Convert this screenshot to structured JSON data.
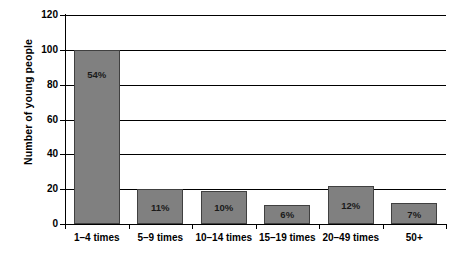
{
  "chart_data": {
    "type": "bar",
    "title": "",
    "subtitle": "",
    "xlabel": "",
    "ylabel": "Number of young people",
    "categories": [
      "1–4 times",
      "5–9 times",
      "10–14 times",
      "15–19 times",
      "20–49 times",
      "50+"
    ],
    "values": [
      100,
      20,
      19,
      11,
      22,
      12
    ],
    "data_labels": [
      "54%",
      "11%",
      "10%",
      "6%",
      "12%",
      "7%"
    ],
    "ylim": [
      0,
      120
    ],
    "ytick_values": [
      0,
      20,
      40,
      60,
      80,
      100,
      120
    ],
    "ytick_labels": [
      "0",
      "20",
      "40",
      "60",
      "80",
      "100",
      "120"
    ],
    "grid": "horizontal",
    "legend": "none",
    "bar_color": "#808080",
    "bar_edge_color": "#404040",
    "background_color": "#ffffff",
    "axis_color": "#000000",
    "label_text_color": "#1a1a1a"
  }
}
